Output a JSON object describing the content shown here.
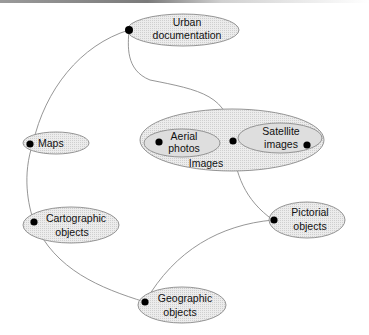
{
  "diagram": {
    "nodes": [
      {
        "id": "urban",
        "lines": [
          "Urban",
          "documentation"
        ]
      },
      {
        "id": "maps",
        "lines": [
          "Maps"
        ]
      },
      {
        "id": "images",
        "lines": [
          "Images"
        ]
      },
      {
        "id": "aerial",
        "lines": [
          "Aerial",
          "photos"
        ]
      },
      {
        "id": "satellite",
        "lines": [
          "Satellite",
          "images"
        ]
      },
      {
        "id": "cartographic",
        "lines": [
          "Cartographic",
          "objects"
        ]
      },
      {
        "id": "pictorial",
        "lines": [
          "Pictorial",
          "objects"
        ]
      },
      {
        "id": "geographic",
        "lines": [
          "Geographic",
          "objects"
        ]
      }
    ],
    "edges": [
      {
        "from": "urban",
        "to": "maps"
      },
      {
        "from": "maps",
        "to": "cartographic"
      },
      {
        "from": "cartographic",
        "to": "geographic"
      },
      {
        "from": "geographic",
        "to": "pictorial"
      },
      {
        "from": "urban",
        "to": "images"
      },
      {
        "from": "images",
        "to": "pictorial"
      }
    ],
    "colors": {
      "node_fill": "#e4e4e4",
      "stroke": "#8a8a8a",
      "dot": "#000000"
    }
  }
}
